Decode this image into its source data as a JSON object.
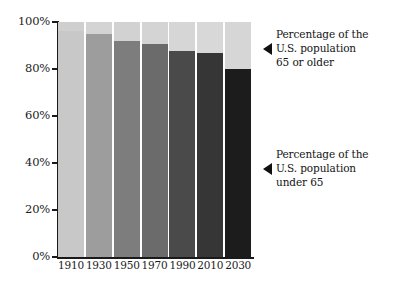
{
  "chart_data": {
    "type": "bar",
    "subtype": "stacked-percentage",
    "title": "",
    "xlabel": "",
    "ylabel": "",
    "ylim": [
      0,
      100
    ],
    "grid": false,
    "legend_position": "right-annotations",
    "categories": [
      "1910",
      "1930",
      "1950",
      "1970",
      "1990",
      "2010",
      "2030"
    ],
    "ytick_labels": [
      "0%",
      "20%",
      "40%",
      "60%",
      "80%",
      "100%"
    ],
    "ytick_values": [
      0,
      20,
      40,
      60,
      80,
      100
    ],
    "series": [
      {
        "name": "Percentage of the U.S. population under 65",
        "values": [
          96,
          95,
          92,
          90.5,
          87.5,
          87,
          80
        ],
        "colors": [
          "#c8c8c8",
          "#9d9d9d",
          "#7d7d7d",
          "#6b6b6b",
          "#4a4a4a",
          "#363636",
          "#1c1c1c"
        ]
      },
      {
        "name": "Percentage of the U.S. population 65 or older",
        "values": [
          4,
          5,
          8,
          9.5,
          12.5,
          13,
          20
        ],
        "colors": [
          "#cfcfcf",
          "#d4d4d4",
          "#d2d2d2",
          "#d4d4d4",
          "#d6d6d6",
          "#d8d8d8",
          "#d6d6d6"
        ]
      }
    ]
  },
  "axes": {
    "y_ticks": [
      {
        "label": "100%",
        "value": 100
      },
      {
        "label": "80%",
        "value": 80
      },
      {
        "label": "60%",
        "value": 60
      },
      {
        "label": "40%",
        "value": 40
      },
      {
        "label": "20%",
        "value": 20
      },
      {
        "label": "0%",
        "value": 0
      }
    ],
    "x_ticks": [
      "1910",
      "1930",
      "1950",
      "1970",
      "1990",
      "2010",
      "2030"
    ]
  },
  "annotations": [
    {
      "id": "over-65",
      "text": "Percentage of the\nU.S. population\n65 or older",
      "arrow": "left-triangle"
    },
    {
      "id": "under-65",
      "text": "Percentage of the\nU.S. population\nunder 65",
      "arrow": "left-triangle"
    }
  ],
  "colors": {
    "axis": "#1a1a1a",
    "text": "#1c1c1c",
    "background": "#ffffff"
  }
}
